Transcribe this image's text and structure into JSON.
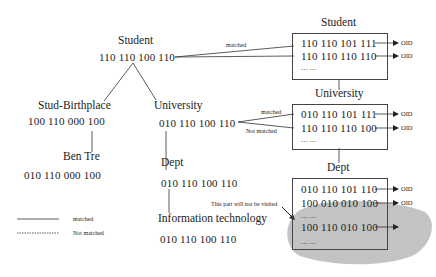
{
  "tree": {
    "root": {
      "label": "Student",
      "code": "110 110 100 110"
    },
    "stud_birthplace": {
      "label": "Stud-Birthplace",
      "code": "100 110 000 100"
    },
    "ben_tre": {
      "label": "Ben Tre",
      "code": "010 110 000 100"
    },
    "university": {
      "label": "University",
      "code": "010 110 100 110"
    },
    "dept": {
      "label": "Dept",
      "code": "010 110 100 110"
    },
    "info_tech": {
      "label": "Information technology",
      "code": "010 110 100 110"
    }
  },
  "index": {
    "student": {
      "title": "Student",
      "rows": [
        "110 110 101 111",
        "110 110 110 110",
        "... ..."
      ],
      "oids": [
        "OID",
        "OID"
      ],
      "edge_label": "matched"
    },
    "university": {
      "title": "University",
      "rows": [
        "010 110 101 111",
        "110 110 110 100",
        "... ..."
      ],
      "oids": [
        "OID",
        "OID"
      ],
      "edge_labels": [
        "matched",
        "Not matched"
      ]
    },
    "dept": {
      "title": "Dept",
      "rows": [
        "010 110 101 110",
        "100 010 010 100",
        "... ...",
        "100 110 010 100",
        "... ..."
      ],
      "oids": [
        "OID",
        "OID"
      ],
      "annotation": "This part will not be visited"
    }
  },
  "legend": {
    "items": [
      {
        "style": "solid",
        "label": "matched"
      },
      {
        "style": "dotted",
        "label": "Not matched"
      }
    ]
  },
  "colors": {
    "line": "#333333",
    "blob": "#b3b3b3",
    "text": "#222222"
  }
}
